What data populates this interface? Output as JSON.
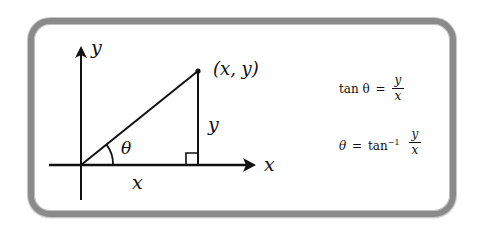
{
  "diagram": {
    "axes": {
      "x_label": "x",
      "y_label": "y"
    },
    "point_label": "(x, y)",
    "angle_label": "θ",
    "adjacent_label": "x",
    "opposite_label": "y",
    "equations": [
      {
        "lhs": "tan θ",
        "eq": "=",
        "num": "y",
        "den": "x"
      },
      {
        "lhs": "θ",
        "eq": "=",
        "func": "tan",
        "sup": "−1",
        "num": "y",
        "den": "x"
      }
    ],
    "colors": {
      "ink": "#111111",
      "frame": "#8a8a8a",
      "background": "#ffffff"
    }
  }
}
